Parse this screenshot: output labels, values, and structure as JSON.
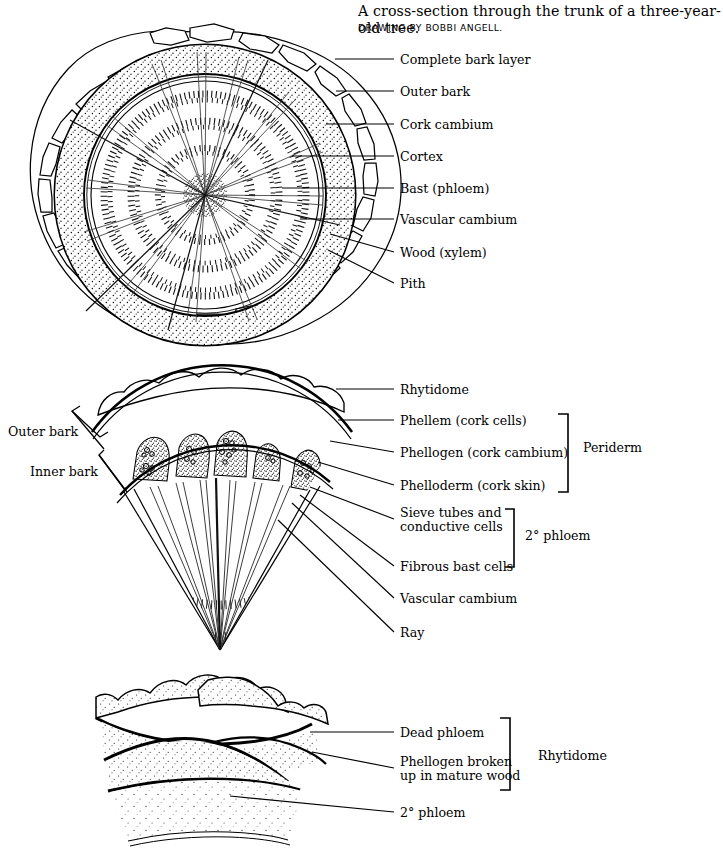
{
  "caption": {
    "title": "A cross-section through the trunk of a three-year-old tree.",
    "credit": "DRAWING BY BOBBI ANGELL."
  },
  "figures": [
    {
      "id": "trunk-cross-section",
      "name": "tree-trunk-cross-section-diagram",
      "labels": [
        {
          "text": "Complete bark layer",
          "x": 400,
          "y": 53
        },
        {
          "text": "Outer bark",
          "x": 400,
          "y": 85
        },
        {
          "text": "Cork cambium",
          "x": 400,
          "y": 118
        },
        {
          "text": "Cortex",
          "x": 400,
          "y": 150
        },
        {
          "text": "Bast (phloem)",
          "x": 400,
          "y": 182
        },
        {
          "text": "Vascular cambium",
          "x": 400,
          "y": 213
        },
        {
          "text": "Wood (xylem)",
          "x": 400,
          "y": 246
        },
        {
          "text": "Pith",
          "x": 400,
          "y": 277
        }
      ]
    },
    {
      "id": "bark-wedge",
      "name": "bark-wedge-detail-diagram",
      "labels": [
        {
          "text": "Rhytidome",
          "x": 400,
          "y": 383
        },
        {
          "text": "Phellem (cork cells)",
          "x": 400,
          "y": 414
        },
        {
          "text": "Phellogen (cork cambium)",
          "x": 400,
          "y": 446
        },
        {
          "text": "Phelloderm (cork skin)",
          "x": 400,
          "y": 479
        },
        {
          "text": "Sieve tubes and",
          "x": 400,
          "y": 513
        },
        {
          "text": "conductive cells",
          "x": 400,
          "y": 527
        },
        {
          "text": "Fibrous bast cells",
          "x": 400,
          "y": 560
        },
        {
          "text": "Vascular cambium",
          "x": 400,
          "y": 592
        },
        {
          "text": "Ray",
          "x": 400,
          "y": 626
        }
      ],
      "side_labels": [
        {
          "text": "Outer bark",
          "x": 8,
          "y": 424
        },
        {
          "text": "Inner bark",
          "x": 30,
          "y": 464
        }
      ],
      "group_labels": [
        {
          "text": "Periderm",
          "x": 583,
          "y": 446
        },
        {
          "text": "2° phloem",
          "x": 525,
          "y": 533
        }
      ]
    },
    {
      "id": "rhytidome-detail",
      "name": "rhytidome-detail-diagram",
      "labels": [
        {
          "text": "Dead phloem",
          "x": 400,
          "y": 726
        },
        {
          "text": "Phellogen broken",
          "x": 400,
          "y": 760
        },
        {
          "text": "up in mature wood",
          "x": 400,
          "y": 774
        },
        {
          "text": "2° phloem",
          "x": 400,
          "y": 806
        }
      ],
      "group_labels": [
        {
          "text": "Rhytidome",
          "x": 538,
          "y": 754
        }
      ]
    }
  ],
  "colors": {
    "ink": "#000000",
    "background": "#ffffff",
    "stipple": "#1a1a1a"
  }
}
